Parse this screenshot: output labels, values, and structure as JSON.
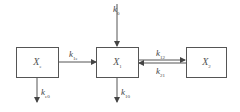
{
  "diagram": {
    "type": "compartment-model",
    "nodes": [
      {
        "id": "Xe",
        "label": "X",
        "sub": "e"
      },
      {
        "id": "X1",
        "label": "X",
        "sub": "1"
      },
      {
        "id": "X2",
        "label": "X",
        "sub": "2"
      }
    ],
    "edges": [
      {
        "id": "k0",
        "from": "input",
        "to": "X1",
        "label": "k",
        "sub": "0"
      },
      {
        "id": "k1e",
        "from": "Xe",
        "to": "X1",
        "label": "k",
        "sub": "1e"
      },
      {
        "id": "k12",
        "from": "X1",
        "to": "X2",
        "label": "k",
        "sub": "12"
      },
      {
        "id": "k21",
        "from": "X2",
        "to": "X1",
        "label": "k",
        "sub": "21"
      },
      {
        "id": "ke0",
        "from": "Xe",
        "to": "output",
        "label": "k",
        "sub": "e0"
      },
      {
        "id": "k10",
        "from": "X1",
        "to": "output",
        "label": "k",
        "sub": "10"
      }
    ],
    "colors": {
      "line": "#555555",
      "text": "#444444",
      "background": "#ffffff"
    }
  }
}
